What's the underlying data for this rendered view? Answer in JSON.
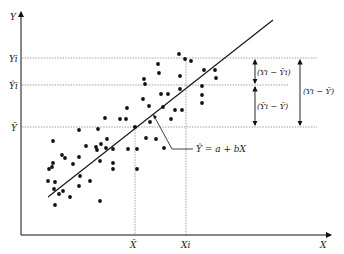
{
  "diagram": {
    "title": "",
    "type": "regression-deviation-diagram",
    "axes": {
      "x_label": "X",
      "y_label": "Y"
    },
    "y_ticks": {
      "yi": "Yi",
      "yhat_i": "Ŷi",
      "ybar": "Ȳ"
    },
    "x_ticks": {
      "xbar": "X̄",
      "xi": "Xi"
    },
    "regression_label": "Ŷ = a + bX",
    "deviation_labels": {
      "residual": "(Yi − Ŷi)",
      "explained": "(Ŷi − Ȳ)",
      "total": "(Yi − Ȳ)"
    },
    "colors": {
      "line": "#111111",
      "points": "#111111",
      "guides": "#888888",
      "background": "#ffffff"
    }
  }
}
